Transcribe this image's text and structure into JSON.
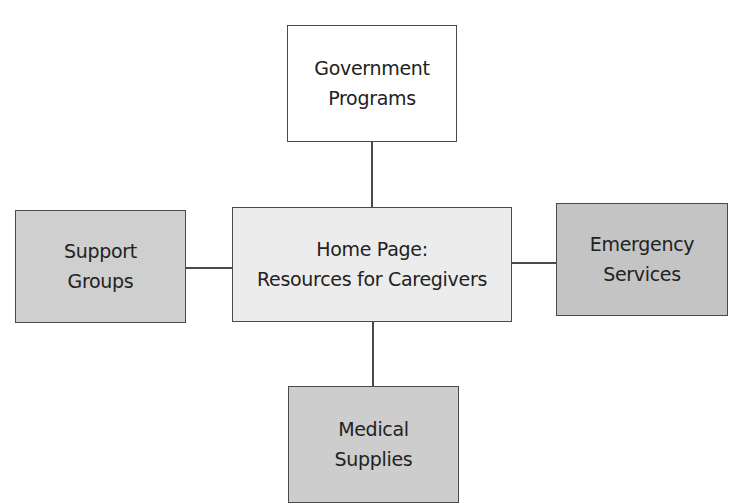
{
  "diagram": {
    "type": "site-map",
    "center": {
      "lines": [
        "Home Page:",
        "Resources for Caregivers"
      ],
      "fill": "#ececec"
    },
    "nodes": {
      "top": {
        "lines": [
          "Government",
          "Programs"
        ],
        "fill": "#ffffff"
      },
      "left": {
        "lines": [
          "Support",
          "Groups"
        ],
        "fill": "#cfcfcf"
      },
      "right": {
        "lines": [
          "Emergency",
          "Services"
        ],
        "fill": "#c4c4c4"
      },
      "bottom": {
        "lines": [
          "Medical",
          "Supplies"
        ],
        "fill": "#cdcdcd"
      }
    },
    "edges": [
      [
        "Home Page",
        "Government Programs"
      ],
      [
        "Home Page",
        "Support Groups"
      ],
      [
        "Home Page",
        "Emergency Services"
      ],
      [
        "Home Page",
        "Medical Supplies"
      ]
    ]
  }
}
